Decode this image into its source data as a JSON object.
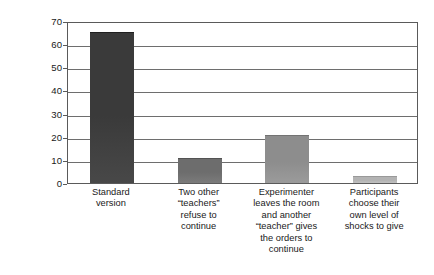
{
  "chart_data": {
    "type": "bar",
    "title": "",
    "xlabel": "",
    "ylabel": "Percentage giving the\nhighest level of shock",
    "ylim": [
      0,
      70
    ],
    "ytick_step": 10,
    "yticks": [
      "0",
      "10",
      "20",
      "30",
      "40",
      "50",
      "60",
      "70"
    ],
    "grid": true,
    "legend": "none",
    "categories": [
      "Standard\nversion",
      "Two other\n“teachers”\nrefuse to\ncontinue",
      "Experimenter\nleaves the room\nand another\n“teacher” gives\nthe orders to\ncontinue",
      "Participants\nchoose their\nown level of\nshocks to give"
    ],
    "values": [
      65,
      10.5,
      20.5,
      2.5
    ],
    "bar_colors": [
      "#3a3a3a",
      "#6d6d6d",
      "#8d8d8d",
      "#b3b3b3"
    ]
  }
}
